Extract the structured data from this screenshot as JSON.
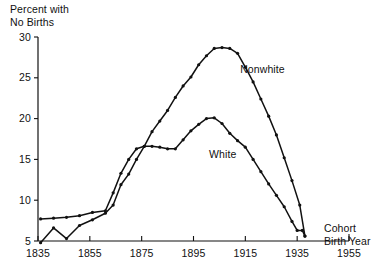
{
  "chart_data": {
    "type": "line",
    "title": "",
    "ylabel": "Percent with\nNo Births",
    "ylabel_line1": "Percent with",
    "ylabel_line2": "No Births",
    "xlabel": "Cohort\nBirth Year",
    "xlabel_line1": "Cohort",
    "xlabel_line2": "Birth Year",
    "xlim": [
      1835,
      1955
    ],
    "ylim": [
      5,
      30
    ],
    "grid": false,
    "legend_position": "inline-annotation",
    "xticks": [
      1835,
      1855,
      1875,
      1895,
      1915,
      1935,
      1955
    ],
    "xtick_labels": [
      "1835",
      "1855",
      "1875",
      "1895",
      "1915",
      "1935",
      "1955"
    ],
    "yticks": [
      5,
      10,
      15,
      20,
      25,
      30
    ],
    "ytick_labels": [
      "5",
      "10",
      "15",
      "20",
      "25",
      "30"
    ],
    "annotations": [
      {
        "text": "Nonwhite",
        "x": 1913,
        "y": 26.0
      },
      {
        "text": "White",
        "x": 1901,
        "y": 15.6
      }
    ],
    "series": [
      {
        "name": "Nonwhite",
        "color": "#111111",
        "marker": "dot",
        "x": [
          1836,
          1841,
          1846,
          1851,
          1856,
          1861,
          1864,
          1867,
          1870,
          1873,
          1876,
          1879,
          1882,
          1885,
          1888,
          1891,
          1894,
          1897,
          1900,
          1903,
          1906,
          1909,
          1912,
          1915,
          1918,
          1921,
          1924,
          1927,
          1930,
          1933,
          1936,
          1938
        ],
        "y": [
          4.8,
          6.6,
          5.3,
          6.9,
          7.6,
          8.4,
          9.4,
          11.9,
          13.2,
          15.0,
          16.6,
          18.4,
          19.7,
          21.0,
          22.6,
          24.0,
          25.1,
          26.6,
          27.7,
          28.6,
          28.7,
          28.6,
          28.0,
          26.3,
          24.5,
          22.4,
          20.3,
          18.0,
          15.2,
          12.4,
          9.4,
          5.6
        ]
      },
      {
        "name": "White",
        "color": "#111111",
        "marker": "dot",
        "x": [
          1836,
          1841,
          1846,
          1851,
          1856,
          1861,
          1864,
          1867,
          1870,
          1873,
          1876,
          1879,
          1882,
          1885,
          1888,
          1891,
          1894,
          1897,
          1900,
          1903,
          1906,
          1909,
          1912,
          1915,
          1918,
          1921,
          1924,
          1927,
          1930,
          1933,
          1935,
          1937,
          1938
        ],
        "y": [
          7.7,
          7.8,
          7.9,
          8.1,
          8.5,
          8.7,
          10.9,
          13.3,
          15.0,
          16.3,
          16.6,
          16.6,
          16.5,
          16.3,
          16.3,
          17.4,
          18.5,
          19.3,
          20.0,
          20.1,
          19.4,
          18.2,
          17.3,
          16.5,
          15.0,
          13.5,
          12.0,
          10.6,
          9.2,
          7.4,
          6.3,
          6.3,
          5.6
        ]
      }
    ]
  },
  "plot_geometry": {
    "left_px": 38,
    "right_px": 349,
    "top_px": 37,
    "bottom_px": 241,
    "x_min": 1835,
    "x_max": 1955,
    "y_min": 5,
    "y_max": 30
  }
}
